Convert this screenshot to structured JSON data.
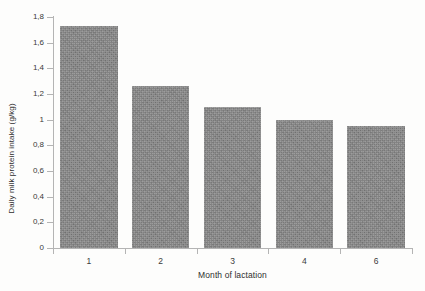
{
  "chart_data": {
    "type": "bar",
    "title": "",
    "xlabel": "Month of lactation",
    "ylabel": "Daily milk protein intake (g/kg)",
    "categories": [
      "1",
      "2",
      "3",
      "4",
      "6"
    ],
    "values": [
      1.73,
      1.26,
      1.1,
      1.0,
      0.95
    ],
    "ylim": [
      0,
      1.8
    ],
    "ytick_labels": [
      "0",
      "0,2",
      "0,4",
      "0,6",
      "0,8",
      "1",
      "1,2",
      "1,4",
      "1,6",
      "1,8"
    ],
    "ytick_values": [
      0,
      0.2,
      0.4,
      0.6,
      0.8,
      1.0,
      1.2,
      1.4,
      1.6,
      1.8
    ],
    "grid": false,
    "legend": null,
    "series": [
      {
        "name": "Daily milk protein intake",
        "values": [
          1.73,
          1.26,
          1.1,
          1.0,
          0.95
        ]
      }
    ],
    "bar_color": "#848484",
    "axis_color": "#b4b4b4",
    "background_color": "#fdfdfc",
    "text_color": "#2e2e2e"
  }
}
